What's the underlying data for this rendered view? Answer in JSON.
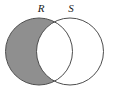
{
  "figure": {
    "kind": "venn-diagram",
    "width": 114,
    "height": 91,
    "background_color": "#ffffff",
    "caption": ""
  },
  "labels": {
    "left_set": "R",
    "right_set": "S"
  },
  "chart_data": {
    "type": "diagram",
    "diagram_type": "venn",
    "title": "",
    "sets": [
      {
        "name": "R",
        "label": "R",
        "position": "left",
        "center_x": 39,
        "center_y": 51.5,
        "radius": 33.5,
        "outline_color": "#4d4d4d",
        "label_x": 41,
        "label_y": 12
      },
      {
        "name": "S",
        "label": "S",
        "position": "right",
        "center_x": 70,
        "center_y": 51.5,
        "radius": 33.5,
        "outline_color": "#4d4d4d",
        "label_x": 71,
        "label_y": 12
      }
    ],
    "regions": [
      {
        "id": "R-only",
        "expression": "R \\ S",
        "shaded": true,
        "fill_color": "#8f8f8f"
      },
      {
        "id": "R-and-S",
        "expression": "R ∩ S",
        "shaded": false,
        "fill_color": "#ffffff"
      },
      {
        "id": "S-only",
        "expression": "S \\ R",
        "shaded": false,
        "fill_color": "#ffffff"
      }
    ],
    "shaded_expression": "R \\ S",
    "shaded_fill_color": "#8f8f8f",
    "unshaded_fill_color": "#ffffff",
    "outline_color": "#4d4d4d",
    "outline_width": 1,
    "legend": "none",
    "grid": false
  }
}
